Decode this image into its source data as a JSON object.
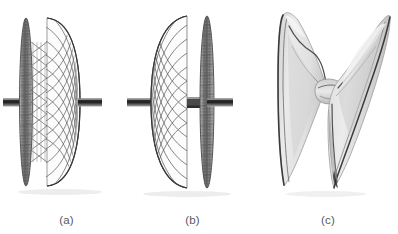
{
  "figure": {
    "background_color": "#ffffff",
    "caption_color": "#585858",
    "panels": [
      {
        "id": "a",
        "caption": "(a)",
        "description": "Braided mesh occluder device, side view, flat disc on left and domed mesh disc on right, mounted on a horizontal delivery shaft",
        "left_disc": {
          "type": "flat-disc-edge-on",
          "fill_color": "#8e8e8e",
          "outline_color": "#4a4a4a"
        },
        "right_disc": {
          "type": "domed-mesh",
          "mesh_color": "#6d6d6d",
          "outline_color": "#454545"
        },
        "waist": {
          "type": "braided-waist",
          "mesh_color": "#707070"
        },
        "shaft": {
          "color": "#3a3a3a",
          "highlight_color": "#9b9b9b"
        }
      },
      {
        "id": "b",
        "caption": "(b)",
        "description": "Same device mirrored, domed mesh disc on left and flat disc on right, mounted on a horizontal delivery shaft",
        "left_disc": {
          "type": "domed-mesh",
          "mesh_color": "#6d6d6d",
          "outline_color": "#454545"
        },
        "right_disc": {
          "type": "flat-disc-edge-on",
          "fill_color": "#8e8e8e",
          "outline_color": "#4a4a4a"
        },
        "waist": {
          "type": "braided-waist",
          "mesh_color": "#707070"
        },
        "shaft": {
          "color": "#3a3a3a",
          "highlight_color": "#9b9b9b"
        }
      },
      {
        "id": "c",
        "caption": "(c)",
        "description": "Collapsed fabric occluder device, hourglass / bowtie shape, light grey membranous lobes with dark fold lines",
        "body": {
          "fill_color": "#e2e2e2",
          "shade_color": "#bfbfbf",
          "fold_line_color": "#4e4e4e"
        }
      }
    ]
  }
}
